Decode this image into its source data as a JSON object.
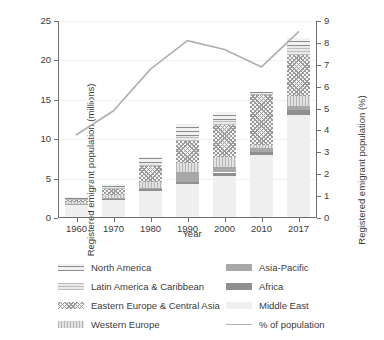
{
  "chart_data": {
    "type": "bar",
    "title": "",
    "subtitle": "",
    "xlabel": "Year",
    "ylabel": "Registered emigrant population (millions)",
    "ylabel_right": "Registered emigrant population (%)",
    "categories": [
      "1960",
      "1970",
      "1980",
      "1990",
      "2000",
      "2010",
      "2017"
    ],
    "ylim": [
      0,
      25
    ],
    "yticks": [
      0,
      5,
      10,
      15,
      20,
      25
    ],
    "ylim_right": [
      0,
      9
    ],
    "yticks_right": [
      0,
      1,
      2,
      3,
      4,
      5,
      6,
      7,
      8,
      9
    ],
    "grid": true,
    "legend_position": "below",
    "stacked": true,
    "stack_order_bottom_to_top": [
      "Middle East",
      "Africa",
      "Asia-Pacific",
      "Western Europe",
      "Eastern Europe & Central Asia",
      "Latin America & Caribbean",
      "North America"
    ],
    "series": [
      {
        "name": "Middle East",
        "key": "middle-east",
        "values": [
          1.5,
          2.15,
          3.25,
          4.15,
          5.25,
          7.85,
          13.0
        ]
      },
      {
        "name": "Africa",
        "key": "africa",
        "values": [
          0.1,
          0.15,
          0.3,
          0.35,
          0.4,
          0.45,
          0.55
        ]
      },
      {
        "name": "Asia-Pacific",
        "key": "asia-pacific",
        "values": [
          0.1,
          0.1,
          0.15,
          1.25,
          0.65,
          0.45,
          0.5
        ]
      },
      {
        "name": "Western Europe",
        "key": "western-europe",
        "values": [
          0.2,
          0.35,
          0.7,
          1.1,
          1.3,
          0.4,
          1.35
        ]
      },
      {
        "name": "Eastern Europe & Central Asia",
        "key": "eastern-europe",
        "values": [
          0.25,
          0.8,
          2.1,
          2.85,
          4.05,
          6.3,
          5.1
        ]
      },
      {
        "name": "Latin America & Caribbean",
        "key": "latin-america",
        "values": [
          0.1,
          0.2,
          0.35,
          0.55,
          0.6,
          0.25,
          1.25
        ]
      },
      {
        "name": "North America",
        "key": "north-america",
        "values": [
          0.25,
          0.45,
          0.75,
          1.6,
          1.05,
          0.2,
          0.95
        ]
      }
    ],
    "totals": [
      2.5,
      4.2,
      7.6,
      11.85,
      13.3,
      15.9,
      22.7
    ],
    "line_series": {
      "name": "% of population",
      "key": "pct-of-population",
      "axis": "right",
      "values": [
        3.8,
        4.9,
        6.8,
        8.1,
        7.7,
        6.9,
        8.5
      ]
    }
  },
  "axes": {
    "left_title": "Registered emigrant population (millions)",
    "right_title": "Registered emigrant population (%)",
    "x_title": "Year",
    "left_ticks": [
      "0",
      "5",
      "10",
      "15",
      "20",
      "25"
    ],
    "right_ticks": [
      "0",
      "1",
      "2",
      "3",
      "4",
      "5",
      "6",
      "7",
      "8",
      "9"
    ],
    "x_ticks": [
      "1960",
      "1970",
      "1980",
      "1990",
      "2000",
      "2010",
      "2017"
    ]
  },
  "legend": {
    "items": [
      {
        "label": "North America",
        "key": "north-america",
        "swatch": "pattern-swatch"
      },
      {
        "label": "Asia-Pacific",
        "key": "asia-pacific",
        "swatch": "solid-swatch"
      },
      {
        "label": "Latin America & Caribbean",
        "key": "latin-america",
        "swatch": "pattern-swatch"
      },
      {
        "label": "Africa",
        "key": "africa",
        "swatch": "solid-swatch"
      },
      {
        "label": "Eastern Europe & Central Asia",
        "key": "eastern-europe",
        "swatch": "pattern-swatch"
      },
      {
        "label": "Middle East",
        "key": "middle-east",
        "swatch": "solid-swatch"
      },
      {
        "label": "Western Europe",
        "key": "western-europe",
        "swatch": "pattern-swatch"
      },
      {
        "label": "% of population",
        "key": "pct-of-population",
        "swatch": "line-swatch"
      }
    ]
  },
  "colors": {
    "line": "#b0b0b0",
    "axis": "#6e6e6e",
    "grid": "#f0f0f0",
    "text": "#3b3b3b",
    "middle_east": "#efefef",
    "africa": "#8f8f8f",
    "asia_pacific": "#a8a8a8"
  }
}
